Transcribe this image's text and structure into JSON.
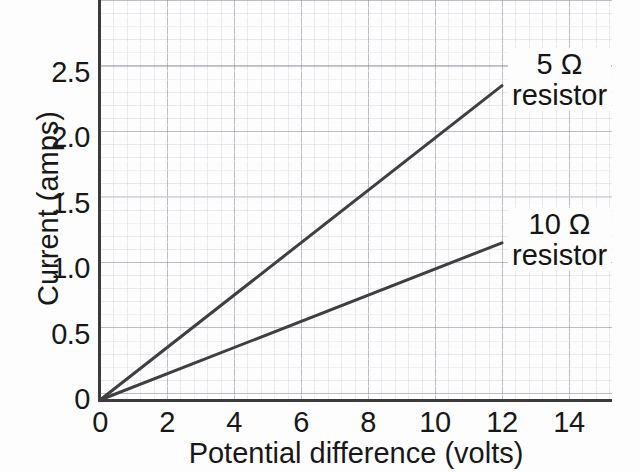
{
  "chart_data": {
    "type": "line",
    "title": "",
    "xlabel": "Potential difference (volts)",
    "ylabel": "Current (amps)",
    "xlim": [
      0,
      15.3
    ],
    "ylim": [
      0,
      3.05
    ],
    "grid": true,
    "legend_position": "in-plot annotations at line ends",
    "xticks": [
      "0",
      "2",
      "4",
      "6",
      "8",
      "10",
      "12",
      "14"
    ],
    "xtick_values": [
      0,
      2,
      4,
      6,
      8,
      10,
      12,
      14
    ],
    "yticks": [
      "0",
      "0.5",
      "1.0",
      "1.5",
      "2.0",
      "2.5"
    ],
    "ytick_values": [
      0,
      0.5,
      1.0,
      1.5,
      2.0,
      2.5
    ],
    "series": [
      {
        "name": "5 Ω resistor",
        "resistance_ohms": 5,
        "slope_amps_per_volt": 0.2,
        "x": [
          0,
          12
        ],
        "values": [
          0,
          2.4
        ],
        "annotation_line1": "5 Ω",
        "annotation_line2": "resistor"
      },
      {
        "name": "10 Ω resistor",
        "resistance_ohms": 10,
        "slope_amps_per_volt": 0.1,
        "x": [
          0,
          12
        ],
        "values": [
          0,
          1.2
        ],
        "annotation_line1": "10 Ω",
        "annotation_line2": "resistor"
      }
    ]
  },
  "axes": {
    "y_title": "Current (amps)",
    "x_title": "Potential difference (volts)",
    "y_tick_labels": [
      "2.5",
      "2.0",
      "1.5",
      "1.0",
      "0.5",
      "0"
    ],
    "x_tick_labels": [
      "0",
      "2",
      "4",
      "6",
      "8",
      "10",
      "12",
      "14"
    ]
  },
  "colors": {
    "line": "#3f3f42",
    "axis": "#3b3b3b",
    "grid_major": "#787d8c",
    "grid_minor": "#969aaa",
    "text": "#181818",
    "background": "#fdfdfd"
  }
}
